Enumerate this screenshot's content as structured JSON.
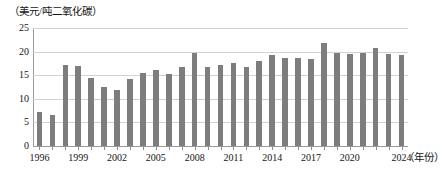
{
  "chart_data": {
    "type": "bar",
    "title": "",
    "subtitle": "",
    "xlabel": "（年份）",
    "ylabel": "（美元/吨二氧化碳）",
    "ylim": [
      0,
      25
    ],
    "ytick_values": [
      25,
      20,
      15,
      10,
      5,
      0
    ],
    "ytick_labels": [
      "25",
      "20",
      "15",
      "10",
      "5",
      "0"
    ],
    "grid": true,
    "legend": null,
    "bar_color": "#7d7d7d",
    "gridline_color": "#d2d2d2",
    "axis_color": "#9a9a9a",
    "xtick_labels": [
      "1996",
      "1999",
      "2002",
      "2005",
      "2008",
      "2011",
      "2014",
      "2017",
      "2020",
      "2024"
    ],
    "xtick_label_years": [
      1996,
      1999,
      2002,
      2005,
      2008,
      2011,
      2014,
      2017,
      2020,
      2024
    ],
    "categories": [
      "1996",
      "1997",
      "1998",
      "1999",
      "2000",
      "2001",
      "2002",
      "2003",
      "2004",
      "2005",
      "2006",
      "2007",
      "2008",
      "2009",
      "2010",
      "2011",
      "2012",
      "2013",
      "2014",
      "2015",
      "2016",
      "2017",
      "2018",
      "2019",
      "2020",
      "2021",
      "2022",
      "2023",
      "2024"
    ],
    "values": [
      7.2,
      6.5,
      17.2,
      17.0,
      14.4,
      12.4,
      11.8,
      14.3,
      15.5,
      16.2,
      15.2,
      16.7,
      19.7,
      16.7,
      17.1,
      17.6,
      16.8,
      18.0,
      19.2,
      18.7,
      18.6,
      18.5,
      21.9,
      19.8,
      19.4,
      19.7,
      20.8,
      19.5,
      19.2
    ]
  }
}
